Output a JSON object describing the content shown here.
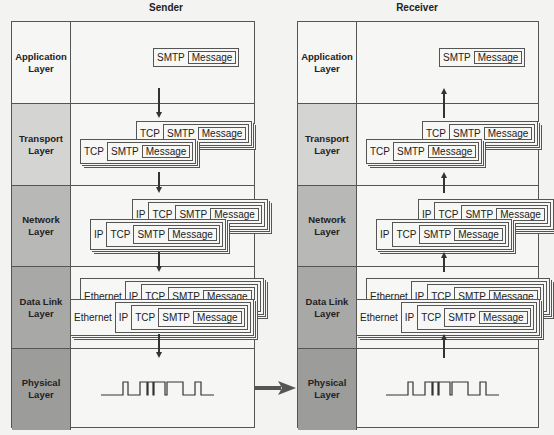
{
  "sender": {
    "title": "Sender",
    "direction": "down",
    "layers": [
      {
        "label": "Application Layer",
        "shade": "#f6f6f4"
      },
      {
        "label": "Transport Layer",
        "shade": "#d4d4d2"
      },
      {
        "label": "Network Layer",
        "shade": "#b8b8b6"
      },
      {
        "label": "Data Link Layer",
        "shade": "#a8a8a6"
      },
      {
        "label": "Physical Layer",
        "shade": "#9c9c9a"
      }
    ]
  },
  "receiver": {
    "title": "Receiver",
    "direction": "up",
    "layers": [
      {
        "label": "Application Layer",
        "shade": "#f6f6f4"
      },
      {
        "label": "Transport Layer",
        "shade": "#d4d4d2"
      },
      {
        "label": "Network Layer",
        "shade": "#b8b8b6"
      },
      {
        "label": "Data Link Layer",
        "shade": "#a8a8a6"
      },
      {
        "label": "Physical Layer",
        "shade": "#9c9c9a"
      }
    ]
  },
  "pdu": {
    "application": [
      "SMTP",
      "Message"
    ],
    "transport": [
      "TCP",
      "SMTP",
      "Message"
    ],
    "network": [
      "IP",
      "TCP",
      "SMTP",
      "Message"
    ],
    "datalink": [
      "Ethernet",
      "IP",
      "TCP",
      "SMTP",
      "Message"
    ]
  },
  "signal": {
    "bits": [
      0,
      1,
      0,
      1,
      1,
      0,
      1,
      0,
      0,
      1,
      0
    ]
  },
  "colors": {
    "line": "#555555",
    "arrow": "#333333",
    "transmit_arrow": "#555555"
  }
}
